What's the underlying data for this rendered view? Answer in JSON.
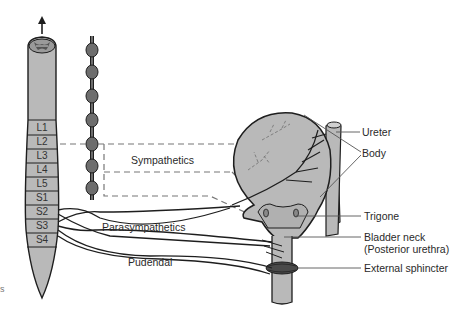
{
  "diagram": {
    "type": "anatomical illustration",
    "colors": {
      "tissue_fill": "#b9b9b9",
      "ganglion_fill": "#6d6d6d",
      "outline": "#1e1e1e",
      "dashed_nerve": "#777777",
      "leader_line": "#555555",
      "text": "#2a2a2a"
    },
    "spinal_cord": {
      "segments": [
        "L1",
        "L2",
        "L3",
        "L4",
        "L5",
        "S1",
        "S2",
        "S3",
        "S4"
      ],
      "arrow": "up-arrow"
    },
    "nerve_labels": {
      "sympathetics": "Sympathetics",
      "parasympathetics": "Parasympathetics",
      "pudendal": "Pudendal"
    },
    "structure_labels": {
      "ureter": "Ureter",
      "body": "Body",
      "trigone": "Trigone",
      "bladder_neck": "Bladder neck",
      "posterior_urethra": "(Posterior urethra)",
      "external_sphincter": "External sphincter"
    },
    "cropped_edge_text": "s"
  }
}
